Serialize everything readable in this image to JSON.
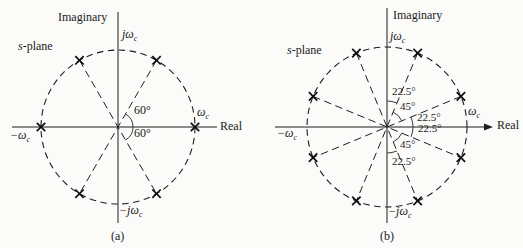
{
  "figure_type": "s-plane pole-location diagrams (Butterworth filter poles)",
  "colors": {
    "ink": "#1d1d1d",
    "background": "#fbfbf9"
  },
  "panels": [
    {
      "name": "a",
      "caption": "(a)",
      "center": {
        "x": 118,
        "y": 127
      },
      "radius": 77,
      "pole_angles_deg": [
        0,
        60,
        120,
        180,
        240,
        300
      ],
      "diagonal_angles_deg": [
        60,
        120
      ],
      "axes": {
        "v_top": 12,
        "v_bottom": 223,
        "h_left": 12,
        "h_right": 217,
        "arrow": false
      },
      "arcs": [
        {
          "r": 15,
          "from": -60,
          "to": 60
        }
      ],
      "angle_labels": [
        {
          "text": "60°",
          "x": 134,
          "y": 104
        },
        {
          "text": "60°",
          "x": 134,
          "y": 127
        }
      ],
      "labels": {
        "imaginary": "Imaginary",
        "real": "Real",
        "splane": {
          "em": "s",
          "rest": "-plane"
        },
        "jwc": {
          "main": "jω",
          "sub": "c"
        },
        "neg_jwc": {
          "main": "−jω",
          "sub": "c"
        },
        "wc": {
          "main": "ω",
          "sub": "c"
        },
        "neg_wc": {
          "main": "−ω",
          "sub": "c"
        }
      }
    },
    {
      "name": "b",
      "caption": "(b)",
      "center": {
        "x": 387,
        "y": 127
      },
      "radius": 80,
      "pole_angles_deg": [
        22.5,
        67.5,
        112.5,
        157.5,
        202.5,
        247.5,
        292.5,
        337.5
      ],
      "diagonal_angles_deg": [
        22.5,
        67.5,
        112.5,
        157.5
      ],
      "axes": {
        "v_top": 8,
        "v_bottom": 223,
        "h_left": 275,
        "h_right": 484,
        "arrow": true
      },
      "arcs": [
        {
          "r": 26,
          "from": 67.5,
          "to": 90
        },
        {
          "r": 16,
          "from": 22.5,
          "to": 67.5
        },
        {
          "r": 26,
          "from": -22.5,
          "to": 22.5
        },
        {
          "r": 16,
          "from": -67.5,
          "to": -22.5
        },
        {
          "r": 26,
          "from": -90,
          "to": -67.5
        }
      ],
      "angle_labels": [
        {
          "text": "22.5°",
          "x": 392,
          "y": 86
        },
        {
          "text": "45°",
          "x": 400,
          "y": 101
        },
        {
          "text": "22.5°",
          "x": 417,
          "y": 112
        },
        {
          "text": "22.5°",
          "x": 418,
          "y": 123
        },
        {
          "text": "45°",
          "x": 400,
          "y": 139
        },
        {
          "text": "22.5°",
          "x": 392,
          "y": 156
        }
      ],
      "labels": {
        "imaginary": "Imaginary",
        "real": "Real",
        "splane": {
          "em": "s",
          "rest": "-plane"
        },
        "jwc": {
          "main": "jω",
          "sub": "c"
        },
        "neg_jwc": {
          "main": "−jω",
          "sub": "c"
        },
        "wc": {
          "main": "ω",
          "sub": "c"
        },
        "neg_wc": {
          "main": "−ω",
          "sub": "c"
        }
      }
    }
  ]
}
